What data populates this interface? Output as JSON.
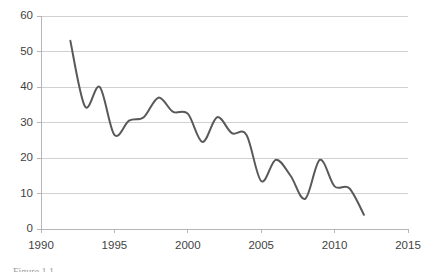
{
  "figure": {
    "caption": "Figure 1.1",
    "background_color": "#ffffff"
  },
  "chart_data": {
    "type": "line",
    "title": "",
    "subtitle": "",
    "xlabel": "",
    "ylabel": "",
    "xlim": [
      1990,
      2015
    ],
    "ylim": [
      0,
      60
    ],
    "x_ticks": [
      1990,
      1995,
      2000,
      2005,
      2010,
      2015
    ],
    "y_ticks": [
      0,
      10,
      20,
      30,
      40,
      50,
      60
    ],
    "x_tick_labels": [
      "1990",
      "1995",
      "2000",
      "2005",
      "2010",
      "2015"
    ],
    "y_tick_labels": [
      "0",
      "10",
      "20",
      "30",
      "40",
      "50",
      "60"
    ],
    "grid": {
      "horizontal": true,
      "vertical": false,
      "color": "#c4c4c4"
    },
    "legend": {
      "visible": false,
      "position": "none",
      "entries": []
    },
    "smoothing": "spline",
    "markers": false,
    "annotations": [],
    "x": [
      1992,
      1993,
      1994,
      1995,
      1996,
      1997,
      1998,
      1999,
      2000,
      2001,
      2002,
      2003,
      2004,
      2005,
      2006,
      2007,
      2008,
      2009,
      2010,
      2011,
      2012
    ],
    "series": [
      {
        "name": "series-1",
        "color": "#595959",
        "line_width": 2,
        "values": [
          53,
          34.5,
          40,
          26.5,
          30.5,
          31.5,
          37,
          33,
          32.5,
          24.5,
          31.5,
          27,
          26.5,
          13.5,
          19.5,
          15,
          8.5,
          19.5,
          12,
          11.5,
          4
        ]
      }
    ]
  },
  "plot_geometry": {
    "left": 41,
    "right": 408,
    "top": 16,
    "bottom": 229
  }
}
